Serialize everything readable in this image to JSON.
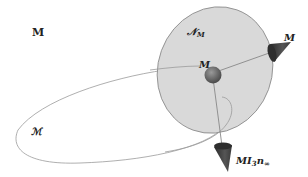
{
  "diagram": {
    "labels": {
      "top_left": "M",
      "loop": "ℳ",
      "disk": "𝒩",
      "disk_sub": "M",
      "center": "M",
      "cone_right": "M",
      "cone_bottom_main": "MI",
      "cone_bottom_sub1": "3",
      "cone_bottom_n": "n",
      "cone_bottom_sub2": "∞"
    },
    "colors": {
      "disk_fill": "#d9d9d9",
      "disk_stroke": "#8a8a8a",
      "sphere": "#6e6e6e",
      "cone": "#3a3a3a",
      "curve": "#9a9a9a"
    }
  }
}
